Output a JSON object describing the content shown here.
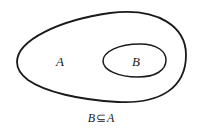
{
  "diagram": {
    "type": "venn-subset",
    "sets": [
      {
        "name": "A",
        "label": "A",
        "role": "outer"
      },
      {
        "name": "B",
        "label": "B",
        "role": "inner"
      }
    ],
    "caption": {
      "left": "B",
      "symbol": "⊆",
      "right": "A"
    },
    "colors": {
      "stroke": "#1a1a1a",
      "background": "#ffffff"
    }
  }
}
